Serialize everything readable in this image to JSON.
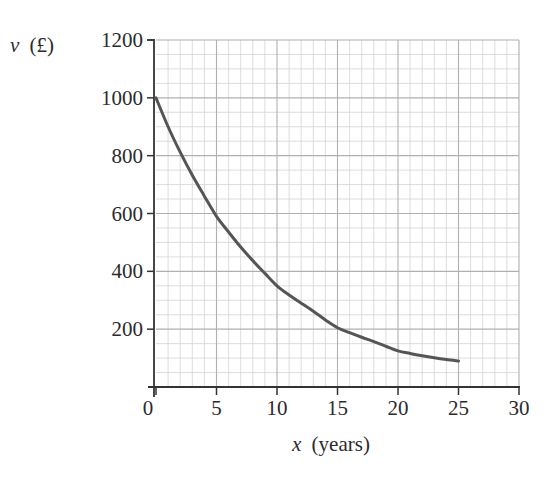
{
  "chart_data": {
    "type": "line",
    "title": "",
    "xlabel": "x (years)",
    "ylabel": "v (£)",
    "xlabel_var": "x",
    "xlabel_unit": "(years)",
    "ylabel_var": "v",
    "ylabel_unit": "(£)",
    "xlim": [
      0,
      30
    ],
    "ylim": [
      0,
      1200
    ],
    "x_ticks": [
      0,
      5,
      10,
      15,
      20,
      25,
      30
    ],
    "y_ticks": [
      200,
      400,
      600,
      800,
      1000,
      1200
    ],
    "x_tick_labels": [
      "0",
      "5",
      "10",
      "15",
      "20",
      "25",
      "30"
    ],
    "y_tick_labels": [
      "200",
      "400",
      "600",
      "800",
      "1000",
      "1200"
    ],
    "grid": true,
    "grid_minor": {
      "x_step": 1,
      "y_step": 50
    },
    "grid_major": {
      "x_step": 5,
      "y_step": 200
    },
    "legend": null,
    "series": [
      {
        "name": "value",
        "x": [
          0,
          1,
          2,
          3,
          4,
          5,
          6,
          7,
          8,
          9,
          10,
          11,
          12,
          13,
          14,
          15,
          16,
          17,
          18,
          19,
          20,
          21,
          22,
          23,
          24,
          25
        ],
        "values": [
          1000,
          900,
          812,
          732,
          660,
          590,
          536,
          484,
          437,
          393,
          350,
          318,
          290,
          262,
          232,
          205,
          188,
          172,
          157,
          141,
          125,
          116,
          108,
          101,
          95,
          90
        ]
      }
    ],
    "colors": {
      "curve": "#555555",
      "axis": "#333333",
      "grid_minor": "#d4d4d4",
      "grid_major": "#b0b0b0"
    }
  }
}
